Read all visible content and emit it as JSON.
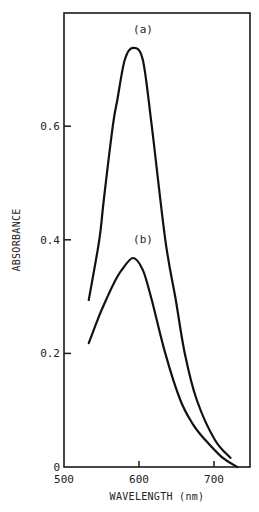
{
  "chart_data": {
    "type": "line",
    "title": "",
    "xlabel": "WAVELENGTH (nm)",
    "ylabel": "ABSORBANCE",
    "xlim": [
      500,
      748
    ],
    "ylim": [
      0,
      0.8
    ],
    "grid": false,
    "legend": "none (curves labeled inline)",
    "x_ticks": [
      500,
      600,
      700
    ],
    "x_tick_labels": [
      "500",
      "600",
      "700"
    ],
    "y_ticks": [
      0,
      0.2,
      0.4,
      0.6
    ],
    "y_tick_labels": [
      "0",
      "0.2",
      "0.4",
      "0.6"
    ],
    "series": [
      {
        "name": "(a)",
        "x": [
          533,
          547,
          553,
          565,
          571,
          581,
          592,
          605,
          617,
          635,
          649,
          661,
          677,
          701,
          722
        ],
        "y": [
          0.294,
          0.4,
          0.47,
          0.6,
          0.646,
          0.717,
          0.738,
          0.717,
          0.6,
          0.4,
          0.294,
          0.2,
          0.118,
          0.048,
          0.016
        ]
      },
      {
        "name": "(b)",
        "x": [
          533,
          545,
          556,
          567,
          577,
          592,
          605,
          617,
          635,
          655,
          672,
          688,
          710,
          731
        ],
        "y": [
          0.218,
          0.26,
          0.294,
          0.325,
          0.347,
          0.368,
          0.347,
          0.294,
          0.2,
          0.118,
          0.075,
          0.048,
          0.018,
          0.0
        ]
      }
    ],
    "annotations": [
      {
        "text": "(a)",
        "x": 592,
        "y": 0.76
      },
      {
        "text": "(b)",
        "x": 592,
        "y": 0.39
      }
    ]
  }
}
